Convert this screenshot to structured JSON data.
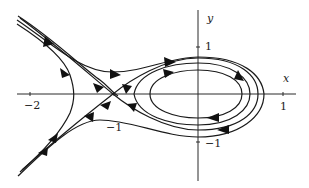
{
  "figure": {
    "axes": {
      "x_label": "x",
      "y_label": "y",
      "x_ticks": [
        {
          "value": -2,
          "label": "−2"
        },
        {
          "value": -1,
          "label": "−1"
        },
        {
          "value": 1,
          "label": "1"
        }
      ],
      "y_ticks": [
        {
          "value": 1,
          "label": "1"
        },
        {
          "value": -1,
          "label": "−1"
        }
      ]
    },
    "features": {
      "saddle_point": {
        "x": -1,
        "y": 0
      },
      "center": {
        "x": 0,
        "y": 0
      },
      "closed_orbits": 3,
      "orbit_direction": "clockwise",
      "left_branch_curves": 4
    },
    "colors": {
      "line": "#1a1a1a",
      "axis": "#2b2b2b",
      "background": "#ffffff"
    }
  }
}
